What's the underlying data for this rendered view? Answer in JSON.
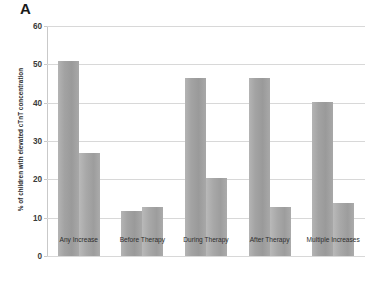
{
  "panel": {
    "label": "A"
  },
  "chart_data": {
    "type": "bar",
    "title": "",
    "subtitle": "",
    "xlabel": "",
    "ylabel": "% of children with elevated cTnT concentration",
    "ylim": [
      0,
      60
    ],
    "ytick_values": [
      0,
      10,
      20,
      30,
      40,
      50,
      60
    ],
    "ytick_labels": [
      "0",
      "10",
      "20",
      "30",
      "40",
      "50",
      "60"
    ],
    "grid": true,
    "legend": "none",
    "categories": [
      "Any Increase",
      "Before Therapy",
      "During Therapy",
      "After Therapy",
      "Multiple Increases"
    ],
    "series": [
      {
        "name": "series-1",
        "color": "#a3a3a3",
        "values": [
          51.0,
          11.8,
          46.5,
          46.5,
          40.3
        ]
      },
      {
        "name": "series-2",
        "color": "#aaaaaa",
        "values": [
          27.0,
          12.8,
          20.4,
          12.8,
          13.8
        ]
      }
    ]
  },
  "style": {
    "gridline_color": "#d8d8d8",
    "axis_color": "#c9c9c9",
    "background": "#ffffff",
    "text_color": "#2e2e2e"
  }
}
